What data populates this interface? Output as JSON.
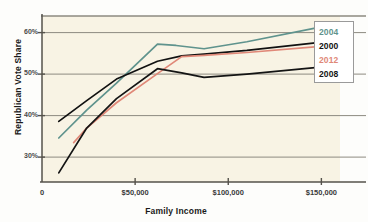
{
  "chart_data": {
    "type": "line",
    "title": "",
    "xlabel": "Family Income",
    "ylabel": "Republican Vote Share",
    "xlim": [
      0,
      160000
    ],
    "ylim": [
      24,
      64
    ],
    "grid": true,
    "legend_position": "top-right",
    "xticks": [
      0,
      50000,
      100000,
      150000
    ],
    "xtick_labels": [
      "0",
      "$50,000",
      "$100,000",
      "$150,000"
    ],
    "yticks": [
      30,
      40,
      50,
      60
    ],
    "ytick_labels": [
      "30%",
      "40%",
      "50%",
      "60%"
    ],
    "series": [
      {
        "name": "2004",
        "color": "#5f938d",
        "x": [
          9000,
          24000,
          40000,
          62000,
          72000,
          87000,
          110000,
          148000
        ],
        "y": [
          34.6,
          41.3,
          47.8,
          57.2,
          56.9,
          56.1,
          57.8,
          61.2
        ]
      },
      {
        "name": "2000",
        "color": "#111111",
        "x": [
          9000,
          24000,
          40000,
          62000,
          75000,
          87000,
          110000,
          148000
        ],
        "y": [
          38.6,
          43.6,
          48.8,
          53.1,
          54.4,
          54.8,
          55.7,
          57.6
        ]
      },
      {
        "name": "2012",
        "color": "#e08878",
        "x": [
          17000,
          24000,
          40000,
          62000,
          75000,
          87000,
          110000,
          148000
        ],
        "y": [
          33.5,
          37.0,
          43.1,
          50.1,
          54.2,
          54.5,
          55.2,
          56.6
        ]
      },
      {
        "name": "2008",
        "color": "#141414",
        "x": [
          9000,
          24000,
          40000,
          62000,
          75000,
          87000,
          110000,
          148000
        ],
        "y": [
          26.2,
          37.0,
          44.1,
          51.3,
          50.3,
          49.2,
          50.0,
          51.6
        ]
      }
    ]
  },
  "legend": {
    "entries": [
      {
        "label": "2004",
        "color": "#5f938d"
      },
      {
        "label": "2000",
        "color": "#111111"
      },
      {
        "label": "2012",
        "color": "#e08878"
      },
      {
        "label": "2008",
        "color": "#141414"
      }
    ]
  },
  "colors": {
    "plot_background": "#f8f3e4",
    "gridline": "#8d8a80",
    "axis": "#55524b",
    "legend_border": "#9a9a9a"
  }
}
